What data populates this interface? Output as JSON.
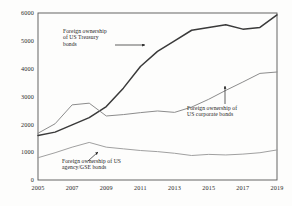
{
  "chart_data": {
    "type": "line",
    "title": "",
    "subtitle": "",
    "xlabel": "",
    "ylabel": "",
    "xlim": [
      2005,
      2019
    ],
    "ylim": [
      0,
      6000
    ],
    "grid": false,
    "legend_position": "inline-annotations",
    "x_ticks": [
      "2005",
      "2007",
      "2009",
      "2011",
      "2013",
      "2015",
      "2017",
      "2019"
    ],
    "x_tick_values": [
      2005,
      2007,
      2009,
      2011,
      2013,
      2015,
      2017,
      2019
    ],
    "y_ticks": [
      "0",
      "1000",
      "2000",
      "3000",
      "4000",
      "5000",
      "6000"
    ],
    "y_tick_values": [
      0,
      1000,
      2000,
      3000,
      4000,
      5000,
      6000
    ],
    "x": [
      2005,
      2006,
      2007,
      2008,
      2009,
      2010,
      2011,
      2012,
      2013,
      2014,
      2015,
      2016,
      2017,
      2018,
      2019
    ],
    "series": [
      {
        "name": "Foreign ownership of US Treasury bonds",
        "color": "#3a3a3a",
        "width": 1.5,
        "values": [
          1600,
          1720,
          1980,
          2240,
          2640,
          3300,
          4080,
          4620,
          5000,
          5380,
          5480,
          5580,
          5420,
          5480,
          5930
        ]
      },
      {
        "name": "Foreign ownership of US corporate bonds",
        "color": "#8c8c8c",
        "width": 1.0,
        "values": [
          1680,
          2020,
          2700,
          2760,
          2300,
          2350,
          2420,
          2480,
          2430,
          2620,
          2900,
          3220,
          3520,
          3830,
          3880
        ]
      },
      {
        "name": "Foreign ownership of US agency/GSE bonds",
        "color": "#a0a0a0",
        "width": 1.0,
        "values": [
          800,
          980,
          1180,
          1350,
          1180,
          1120,
          1060,
          1020,
          960,
          880,
          920,
          900,
          930,
          980,
          1080
        ]
      }
    ],
    "annotations": [
      {
        "id": "treasury-annotation",
        "lines": [
          "Foreign ownership",
          "of US Treasury",
          "bonds"
        ],
        "text_x": 63,
        "text_y": 33,
        "arrow_from_x": 115,
        "arrow_from_y": 45,
        "arrow_to_x": 145,
        "arrow_to_y": 45
      },
      {
        "id": "corporate-annotation",
        "lines": [
          "Foreign ownership of",
          "US corporate bonds"
        ],
        "text_x": 187,
        "text_y": 110,
        "arrow_from_x": 225,
        "arrow_from_y": 104,
        "arrow_to_x": 225,
        "arrow_to_y": 86
      },
      {
        "id": "agency-annotation",
        "lines": [
          "Foreign ownership of US",
          "agency/GSE bonds"
        ],
        "text_x": 62,
        "text_y": 163,
        "arrow_from_x": 88,
        "arrow_from_y": 161,
        "arrow_to_x": 98,
        "arrow_to_y": 152
      }
    ]
  },
  "plot_frame": {
    "left": 38,
    "right": 277,
    "top": 13,
    "bottom": 180,
    "border_color": "#555555"
  }
}
